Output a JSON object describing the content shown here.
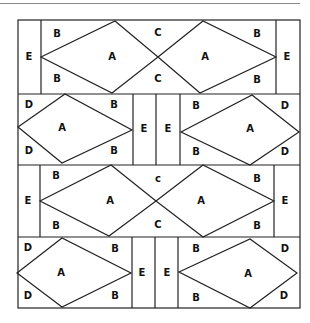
{
  "diagram": {
    "title": "",
    "colors": {
      "line": "#222222",
      "background": "#ffffff",
      "rule": "#8a8a8a"
    },
    "outer_border": {
      "x": 18,
      "y": 20,
      "width": 282,
      "height": 288
    },
    "rows": [
      {
        "id": "row-1",
        "y_top": 20,
        "y_bottom": 94,
        "verticals": [
          41,
          276
        ],
        "diamonds": [
          {
            "points": "41,57 115,21 158,57 112,93"
          },
          {
            "points": "158,57 203,21 276,57 200,93"
          }
        ],
        "lines": [],
        "labels": [
          {
            "text": "E",
            "x": 29,
            "y": 57
          },
          {
            "text": "B",
            "x": 57,
            "y": 34
          },
          {
            "text": "B",
            "x": 57,
            "y": 79
          },
          {
            "text": "A",
            "x": 112,
            "y": 57
          },
          {
            "text": "C",
            "x": 158,
            "y": 33
          },
          {
            "text": "C",
            "x": 158,
            "y": 79
          },
          {
            "text": "A",
            "x": 205,
            "y": 57
          },
          {
            "text": "B",
            "x": 257,
            "y": 34
          },
          {
            "text": "B",
            "x": 257,
            "y": 80
          },
          {
            "text": "E",
            "x": 287,
            "y": 57
          }
        ]
      },
      {
        "id": "row-2",
        "y_top": 94,
        "y_bottom": 165,
        "verticals": [
          133,
          156,
          180
        ],
        "diamonds": [
          {
            "points": "18,127 65,94 132,130 62,163"
          },
          {
            "points": "181,132 252,95 299,132 250,165"
          }
        ],
        "lines": [],
        "labels": [
          {
            "text": "D",
            "x": 29,
            "y": 105
          },
          {
            "text": "B",
            "x": 114,
            "y": 105
          },
          {
            "text": "A",
            "x": 62,
            "y": 128
          },
          {
            "text": "D",
            "x": 29,
            "y": 151
          },
          {
            "text": "B",
            "x": 114,
            "y": 151
          },
          {
            "text": "E",
            "x": 144,
            "y": 129
          },
          {
            "text": "E",
            "x": 168,
            "y": 129
          },
          {
            "text": "B",
            "x": 196,
            "y": 106
          },
          {
            "text": "D",
            "x": 285,
            "y": 106
          },
          {
            "text": "A",
            "x": 250,
            "y": 129
          },
          {
            "text": "B",
            "x": 196,
            "y": 152
          },
          {
            "text": "D",
            "x": 285,
            "y": 152
          }
        ]
      },
      {
        "id": "row-3",
        "y_top": 165,
        "y_bottom": 237,
        "verticals": [
          40,
          274
        ],
        "diamonds": [
          {
            "points": "40,201 111,165 156,201 109,236"
          },
          {
            "points": "156,201 203,165 274,201 203,237"
          }
        ],
        "lines": [],
        "labels": [
          {
            "text": "E",
            "x": 28,
            "y": 201
          },
          {
            "text": "B",
            "x": 56,
            "y": 176
          },
          {
            "text": "B",
            "x": 56,
            "y": 226
          },
          {
            "text": "A",
            "x": 110,
            "y": 201
          },
          {
            "text": "c",
            "x": 158,
            "y": 179
          },
          {
            "text": "C",
            "x": 158,
            "y": 225
          },
          {
            "text": "A",
            "x": 201,
            "y": 201
          },
          {
            "text": "B",
            "x": 257,
            "y": 179
          },
          {
            "text": "B",
            "x": 257,
            "y": 226
          },
          {
            "text": "E",
            "x": 285,
            "y": 201
          }
        ]
      },
      {
        "id": "row-4",
        "y_top": 237,
        "y_bottom": 308,
        "verticals": [
          132,
          155,
          178
        ],
        "diamonds": [
          {
            "points": "17,273 62,238 131,273 62,307"
          },
          {
            "points": "179,272 250,239 297,273 250,308"
          }
        ],
        "lines": [],
        "labels": [
          {
            "text": "D",
            "x": 28,
            "y": 248
          },
          {
            "text": "B",
            "x": 115,
            "y": 249
          },
          {
            "text": "A",
            "x": 61,
            "y": 273
          },
          {
            "text": "D",
            "x": 28,
            "y": 296
          },
          {
            "text": "B",
            "x": 115,
            "y": 296
          },
          {
            "text": "E",
            "x": 142,
            "y": 273
          },
          {
            "text": "E",
            "x": 167,
            "y": 273
          },
          {
            "text": "B",
            "x": 196,
            "y": 249
          },
          {
            "text": "D",
            "x": 285,
            "y": 249
          },
          {
            "text": "A",
            "x": 248,
            "y": 274
          },
          {
            "text": "B",
            "x": 196,
            "y": 298
          },
          {
            "text": "D",
            "x": 284,
            "y": 296
          }
        ]
      }
    ]
  }
}
